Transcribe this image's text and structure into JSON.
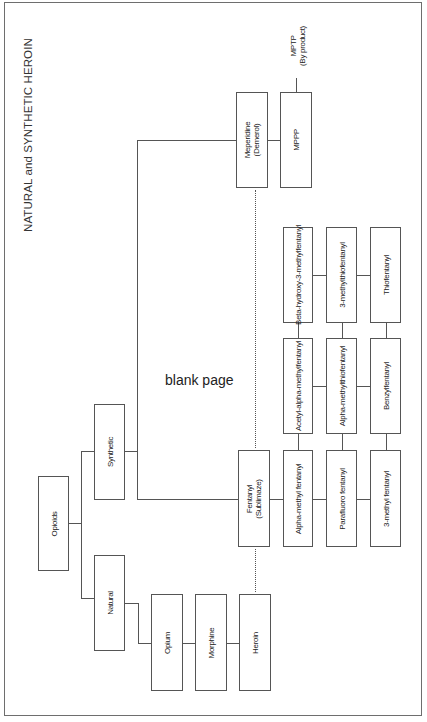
{
  "diagram": {
    "title": "NATURAL and SYNTHETIC HEROIN",
    "watermark": "blank page",
    "nodes": {
      "opioids": "Opioids",
      "synthetic": "Synthetic",
      "natural": "Natural",
      "opium": "Opium",
      "morphine": "Morphine",
      "heroin": "Heroin",
      "meperidine": {
        "line1": "Meperidine",
        "line2": "(Demerol)"
      },
      "mppp": "MPPP",
      "mptp": {
        "line1": "MPTP",
        "line2": "(By product)"
      },
      "fentanyl": {
        "line1": "Fentanyl",
        "line2": "(Sublimaze)"
      },
      "fentanyl_analogs": [
        [
          "Beta-hydroxy-3-methylfentanyl",
          "3-methylthiofentanyl",
          "Thiofentanyl"
        ],
        [
          "Acetyl-alpha-methylfentanyl",
          "Alpha-methylthiofentanyl",
          "Benzylfentanyl"
        ],
        [
          "Alpha-methyl fentanyl",
          "Parafluoro fentanyl",
          "3-methyl fentanyl"
        ]
      ]
    },
    "edges": [
      [
        "Opioids",
        "Synthetic"
      ],
      [
        "Opioids",
        "Natural"
      ],
      [
        "Synthetic",
        "Fentanyl (Sublimaze)"
      ],
      [
        "Synthetic",
        "Meperidine (Demerol)"
      ],
      [
        "Natural",
        "Opium"
      ],
      [
        "Opium",
        "Morphine"
      ],
      [
        "Morphine",
        "Heroin"
      ],
      [
        "Meperidine (Demerol)",
        "MPPP"
      ],
      [
        "MPPP",
        "MPTP (By product)"
      ],
      [
        "Fentanyl (Sublimaze)",
        "Alpha-methyl fentanyl"
      ]
    ],
    "dotted_links": [
      [
        "Heroin",
        "Fentanyl (Sublimaze)"
      ],
      [
        "Fentanyl (Sublimaze)",
        "Meperidine (Demerol)"
      ]
    ]
  }
}
